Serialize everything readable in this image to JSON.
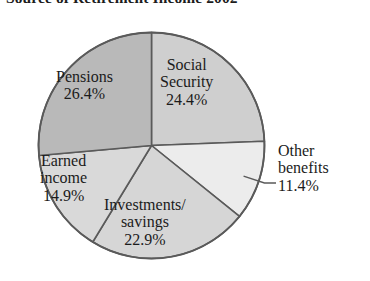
{
  "chart_title": "Source of Retirement Income 2002",
  "chart_data": {
    "type": "pie",
    "title": "Source of Retirement Income 2002",
    "xlabel": "",
    "ylabel": "",
    "legend": "none",
    "grid": false,
    "units": "percent",
    "start_angle_deg": 0,
    "direction": "clockwise",
    "categories": [
      "Social Security",
      "Other benefits",
      "Investments/savings",
      "Earned income",
      "Pensions"
    ],
    "values": [
      24.4,
      11.4,
      22.9,
      14.9,
      26.4
    ],
    "total": 100.0,
    "slices": [
      {
        "name": "social-security",
        "label_line1": "Social",
        "label_line2": "Security",
        "value": 24.4,
        "value_label": "24.4%",
        "color": "#cfcfcf",
        "start_deg": 0.0,
        "end_deg": 87.84,
        "callout": false
      },
      {
        "name": "other-benefits",
        "label_line1": "Other",
        "label_line2": "benefits",
        "value": 11.4,
        "value_label": "11.4%",
        "color": "#ececec",
        "start_deg": 87.84,
        "end_deg": 128.88,
        "callout": true
      },
      {
        "name": "investments-savings",
        "label_line1": "Investments/",
        "label_line2": "savings",
        "value": 22.9,
        "value_label": "22.9%",
        "color": "#d6d6d6",
        "start_deg": 128.88,
        "end_deg": 211.32,
        "callout": false
      },
      {
        "name": "earned-income",
        "label_line1": "Earned",
        "label_line2": "income",
        "value": 14.9,
        "value_label": "14.9%",
        "color": "#d9d9d9",
        "start_deg": 211.32,
        "end_deg": 264.96,
        "callout": false
      },
      {
        "name": "pensions",
        "label_line1": "Pensions",
        "label_line2": "",
        "value": 26.4,
        "value_label": "26.4%",
        "color": "#b9b9b9",
        "start_deg": 264.96,
        "end_deg": 360.0,
        "callout": false
      }
    ],
    "style": {
      "outline_color": "#5a5a5a",
      "background": "#ffffff",
      "text_color": "#1b1b1b"
    }
  }
}
